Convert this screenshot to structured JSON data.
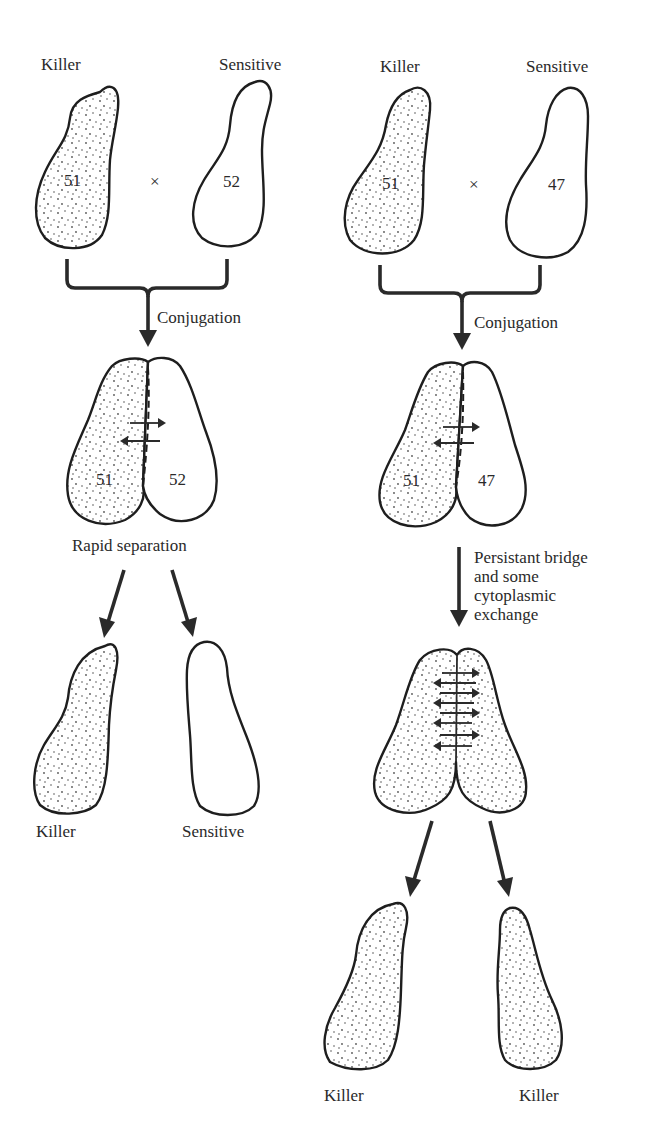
{
  "left_panel": {
    "parents": {
      "killer_label": "Killer",
      "sensitive_label": "Sensitive",
      "killer_mating_type": "51",
      "sensitive_mating_type": "52",
      "cross_symbol": "×"
    },
    "step1_label": "Conjugation",
    "pair": {
      "left_number": "51",
      "right_number": "52"
    },
    "step2_label": "Rapid separation",
    "offspring": {
      "left_label": "Killer",
      "right_label": "Sensitive"
    }
  },
  "right_panel": {
    "parents": {
      "killer_label": "Killer",
      "sensitive_label": "Sensitive",
      "killer_mating_type": "51",
      "sensitive_mating_type": "47",
      "cross_symbol": "×"
    },
    "step1_label": "Conjugation",
    "pair": {
      "left_number": "51",
      "right_number": "47"
    },
    "step2_label_lines": [
      "Persistant bridge",
      "and some",
      "cytoplasmic",
      "exchange"
    ],
    "offspring": {
      "left_label": "Killer",
      "right_label": "Killer"
    }
  },
  "legend": {
    "stippled": "killer cytoplasm (kappa particles)",
    "clear": "sensitive cytoplasm"
  }
}
